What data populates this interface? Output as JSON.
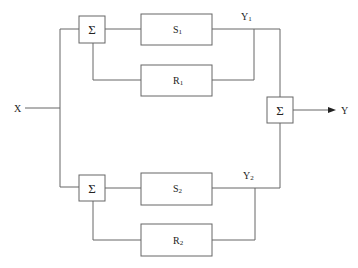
{
  "diagram": {
    "input_label": "X",
    "output_label": "Y",
    "sum_symbol": "Σ",
    "upper": {
      "s_label": "S",
      "s_sub": "1",
      "r_label": "R",
      "r_sub": "1",
      "y_label": "Y",
      "y_sub": "1"
    },
    "lower": {
      "s_label": "S",
      "s_sub": "2",
      "r_label": "R",
      "r_sub": "2",
      "y_label": "Y",
      "y_sub": "2"
    },
    "line_color": "#666666"
  }
}
